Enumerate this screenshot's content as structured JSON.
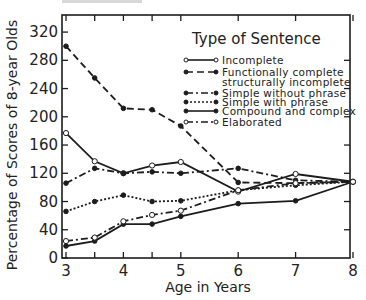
{
  "chart_data": {
    "type": "line",
    "title": "",
    "legend_title": "Type of Sentence",
    "xlabel": "Age in Years",
    "ylabel": "Percentage of Scores of 8-year Olds",
    "xlim": [
      3,
      8
    ],
    "ylim": [
      0,
      320
    ],
    "x_ticks": [
      3,
      4,
      5,
      6,
      7,
      8
    ],
    "x_minor_ticks": [
      3.5,
      4.5
    ],
    "y_ticks": [
      0,
      40,
      80,
      120,
      160,
      200,
      240,
      280,
      320
    ],
    "grid": false,
    "legend_position": "upper right (inside plot)",
    "x": [
      3,
      3.5,
      4,
      4.5,
      5,
      6,
      7,
      8
    ],
    "series": [
      {
        "name": "Incomplete",
        "style": "solid",
        "marker": "open-circle",
        "values": [
          177,
          137,
          120,
          131,
          136,
          94,
          119,
          108
        ]
      },
      {
        "name": "Functionally complete structurally incomplete",
        "label_lines": [
          "Functionally complete",
          "structurally incomplete"
        ],
        "style": "dashed",
        "marker": "filled-circle",
        "values": [
          300,
          255,
          212,
          210,
          187,
          107,
          106,
          108
        ]
      },
      {
        "name": "Simple without phrase",
        "style": "dash-dot",
        "marker": "filled-circle",
        "values": [
          106,
          127,
          120,
          122,
          120,
          127,
          110,
          108
        ]
      },
      {
        "name": "Simple with phrase",
        "style": "dotted",
        "marker": "filled-circle",
        "values": [
          66,
          80,
          89,
          80,
          81,
          96,
          103,
          108
        ]
      },
      {
        "name": "Compound and complex",
        "style": "solid",
        "marker": "filled-circle",
        "values": [
          17,
          24,
          48,
          48,
          59,
          77,
          81,
          108
        ]
      },
      {
        "name": "Elaborated",
        "style": "dash-dot",
        "marker": "open-circle",
        "values": [
          24,
          29,
          52,
          61,
          67,
          96,
          106,
          108
        ]
      }
    ]
  }
}
